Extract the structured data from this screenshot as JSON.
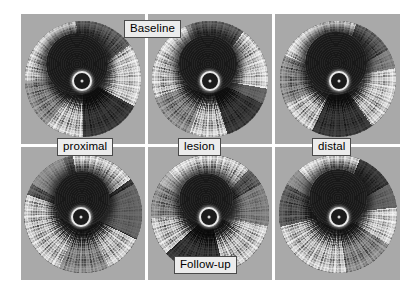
{
  "figure": {
    "type": "ivus-cross-section-grid",
    "modality": "intravascular-ultrasound",
    "rows": 2,
    "columns": 3,
    "background_color": "#ffffff",
    "panel_background_color": "#a9a9a9",
    "divider_color": "#ffffff",
    "label_box_fill": "#ececec",
    "label_box_border": "#4a4a4a"
  },
  "labels": {
    "baseline": "Baseline",
    "proximal": "proximal",
    "lesion": "lesion",
    "distal": "distal",
    "followup": "Follow-up"
  },
  "panels": [
    {
      "id": "p1",
      "row": "Baseline",
      "site": "proximal"
    },
    {
      "id": "p2",
      "row": "Baseline",
      "site": "lesion"
    },
    {
      "id": "p3",
      "row": "Baseline",
      "site": "distal"
    },
    {
      "id": "p4",
      "row": "Follow-up",
      "site": "proximal"
    },
    {
      "id": "p5",
      "row": "Follow-up",
      "site": "lesion"
    },
    {
      "id": "p6",
      "row": "Follow-up",
      "site": "distal"
    }
  ]
}
